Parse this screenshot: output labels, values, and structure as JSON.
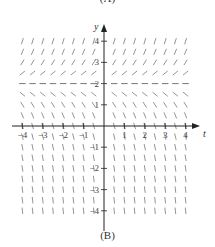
{
  "captions": {
    "top": "(A)",
    "bottom": "(B)"
  },
  "axes": {
    "x_label": "t",
    "y_label": "y",
    "x_ticks": [
      "−4",
      "−3",
      "−2",
      "−1",
      "1",
      "2",
      "3",
      "4"
    ],
    "y_ticks": [
      "4",
      "3",
      "2",
      "1",
      "−1",
      "−2",
      "−3",
      "−4"
    ]
  },
  "chart_data": {
    "type": "slope_field",
    "title": "(B)",
    "xlabel": "t",
    "ylabel": "y",
    "xlim": [
      -4,
      4
    ],
    "ylim": [
      -4,
      4
    ],
    "equilibrium": {
      "y": 2,
      "style": "dashed horizontal segments"
    },
    "grid_spacing": 0.5
  }
}
